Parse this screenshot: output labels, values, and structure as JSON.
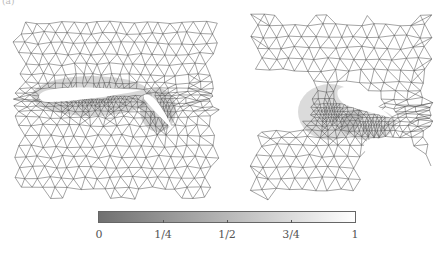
{
  "figure": {
    "panel_label": "(a)",
    "panels": [
      {
        "name": "full-domain-mesh",
        "description": "Triangular mesh around multi-element airfoil (main wing + flap)"
      },
      {
        "name": "zoomed-slot-mesh",
        "description": "Zoomed view of mesh in gap between main wing and flap"
      }
    ],
    "colorbar": {
      "gradient_start": "#707070",
      "gradient_end": "#ffffff",
      "ticks": [
        "0",
        "1/4",
        "1/2",
        "3/4",
        "1"
      ],
      "tick_positions": [
        0,
        0.25,
        0.5,
        0.75,
        1
      ]
    },
    "colors": {
      "mesh_line": "#4a4a4a",
      "dense_mesh": "#2a2a2a",
      "background": "#ffffff"
    }
  }
}
